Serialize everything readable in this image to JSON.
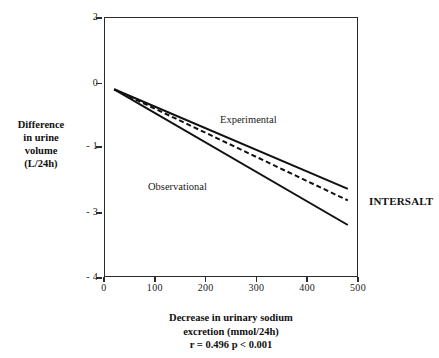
{
  "chart_data": {
    "type": "line",
    "title": "",
    "subtitle": "",
    "xlabel_lines": [
      "Decrease in urinary sodium",
      "excretion (mmol/24h)",
      "r = 0.496 p < 0.001"
    ],
    "ylabel_lines": [
      "Difference",
      "in urine",
      "volume",
      "(L/24h)"
    ],
    "annotation": "INTERSALT",
    "stat_r": "r = 0.496 p < 0.001",
    "grid": false,
    "legend_position": "inline-annotations",
    "xlim": [
      0,
      500
    ],
    "ylim": [
      -4,
      2
    ],
    "xticks": [
      0,
      100,
      200,
      300,
      400,
      500
    ],
    "xtick_labels": [
      "0",
      "100",
      "200",
      "300",
      "400",
      "500"
    ],
    "yticks": [
      2,
      0,
      -1,
      -3,
      -4
    ],
    "ytick_labels": [
      "2",
      "0",
      "- 1",
      "- 3",
      "- 4"
    ],
    "ytick_pixel_fractions": [
      0.0,
      0.2538,
      0.4962,
      0.75,
      1.0
    ],
    "series": [
      {
        "name": "Experimental",
        "style": "solid",
        "color": "#111111",
        "x": [
          20,
          480
        ],
        "values": [
          -0.1,
          -2.3
        ]
      },
      {
        "name": "Overall (dashed)",
        "style": "dashed",
        "color": "#111111",
        "x": [
          20,
          480
        ],
        "values": [
          -0.1,
          -2.65
        ]
      },
      {
        "name": "Observational",
        "style": "solid",
        "color": "#111111",
        "x": [
          20,
          480
        ],
        "values": [
          -0.1,
          -3.2
        ]
      }
    ]
  },
  "axes": {
    "y_ticks": [
      {
        "label": "2",
        "frac": 0.0
      },
      {
        "label": "0",
        "frac": 0.2538
      },
      {
        "label": "- 1",
        "frac": 0.4962
      },
      {
        "label": "- 3",
        "frac": 0.75
      },
      {
        "label": "- 4",
        "frac": 1.0
      }
    ],
    "x_ticks": [
      {
        "label": "0",
        "frac": 0.0
      },
      {
        "label": "100",
        "frac": 0.2
      },
      {
        "label": "200",
        "frac": 0.4
      },
      {
        "label": "300",
        "frac": 0.6
      },
      {
        "label": "400",
        "frac": 0.8
      },
      {
        "label": "500",
        "frac": 1.0
      }
    ]
  },
  "labels": {
    "y_title": [
      "Difference",
      "in urine",
      "volume",
      "(L/24h)"
    ],
    "x_title": [
      "Decrease in urinary sodium",
      "excretion (mmol/24h)",
      "r = 0.496 p < 0.001"
    ],
    "experimental": "Experimental",
    "observational": "Observational",
    "intersalt": "INTERSALT"
  },
  "colors": {
    "line": "#111111",
    "frame": "#2b2b2b",
    "text": "#1a1a1a",
    "background": "#ffffff"
  }
}
